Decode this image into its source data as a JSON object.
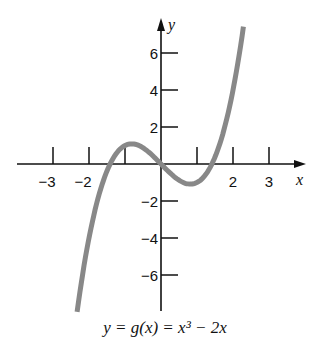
{
  "chart_data": {
    "type": "line",
    "title": "",
    "caption": "y = g(x) = x³ − 2x",
    "xlabel": "x",
    "ylabel": "y",
    "xlim": [
      -3.4,
      3.4
    ],
    "ylim": [
      -8,
      7.5
    ],
    "x_ticks": [
      -3,
      -2,
      -1,
      1,
      2,
      3
    ],
    "x_tick_labels": [
      "−3",
      "−2",
      "",
      "",
      "2",
      "3"
    ],
    "y_ticks": [
      6,
      4,
      2,
      -2,
      -4,
      -6
    ],
    "y_tick_labels": [
      "6",
      "4",
      "2",
      "−2",
      "−4",
      "−6"
    ],
    "grid": false,
    "legend": null,
    "series": [
      {
        "name": "g(x) = x^3 - 2x",
        "color": "#888888",
        "x": [
          -2.36,
          -2.0,
          -1.5,
          -1.414,
          -1.0,
          -0.816,
          -0.5,
          0.0,
          0.5,
          0.816,
          1.0,
          1.414,
          1.5,
          2.0,
          2.28
        ],
        "y": [
          -8.43,
          -4.0,
          -0.375,
          0.0,
          1.0,
          1.089,
          0.875,
          0.0,
          -0.875,
          -1.089,
          -1.0,
          0.0,
          0.375,
          4.0,
          7.29
        ]
      }
    ]
  }
}
